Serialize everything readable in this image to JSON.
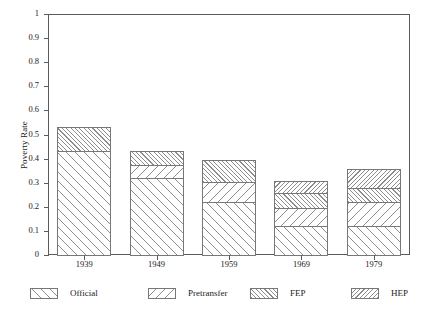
{
  "chart_data": {
    "type": "bar",
    "bar_mode": "stacked",
    "title": "",
    "xlabel": "",
    "ylabel": "Poverty Rate",
    "categories": [
      "1939",
      "1949",
      "1959",
      "1969",
      "1979"
    ],
    "ylim": [
      0,
      1
    ],
    "ytick_labels": [
      "0",
      "0.1",
      "0.2",
      "0.3",
      "0.4",
      "0.5",
      "0.6",
      "0.7",
      "0.8",
      "0.9",
      "1"
    ],
    "ytick_values": [
      0,
      0.1,
      0.2,
      0.3,
      0.4,
      0.5,
      0.6,
      0.7,
      0.8,
      0.9,
      1
    ],
    "grid": false,
    "legend_position": "bottom",
    "series": [
      {
        "name": "Official",
        "pattern": "diagonal-forward-sparse",
        "values": [
          0.435,
          0.325,
          0.225,
          0.125,
          0.125
        ]
      },
      {
        "name": "Pretransfer",
        "pattern": "diagonal-backward-sparse",
        "values": [
          0.0,
          0.055,
          0.085,
          0.08,
          0.105
        ]
      },
      {
        "name": "FEP",
        "pattern": "diagonal-forward-dense",
        "values": [
          0.105,
          0.065,
          0.095,
          0.065,
          0.06
        ]
      },
      {
        "name": "HEP",
        "pattern": "diagonal-backward-dense",
        "values": [
          0.0,
          0.0,
          0.0,
          0.055,
          0.085
        ]
      }
    ],
    "totals": [
      0.54,
      0.445,
      0.405,
      0.325,
      0.375
    ],
    "annotations": []
  },
  "legend": {
    "items": [
      {
        "label": "Official"
      },
      {
        "label": "Pretransfer"
      },
      {
        "label": "FEP"
      },
      {
        "label": "HEP"
      }
    ]
  }
}
